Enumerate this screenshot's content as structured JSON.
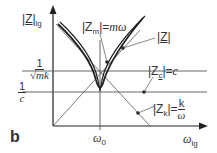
{
  "figure": {
    "panel_label": "b",
    "y_axis": {
      "label_main": "Z",
      "label_sub": "lg"
    },
    "x_axis": {
      "label_main": "ω",
      "label_sub": "lg"
    },
    "x_tick": {
      "label_main": "ω",
      "label_sub": "0"
    },
    "y_ticks": [
      {
        "num": "1",
        "den": "√mk"
      },
      {
        "num": "1",
        "den": "c"
      }
    ],
    "annotations": {
      "zm": {
        "lhs_main": "Z",
        "lhs_sub": "m",
        "rhs": "mω"
      },
      "z": {
        "main": "Z"
      },
      "zc": {
        "lhs_main": "Z",
        "lhs_sub": "c",
        "rhs": "c"
      },
      "zk": {
        "lhs_main": "Z",
        "lhs_sub": "k",
        "num": "k",
        "den": "ω"
      }
    },
    "colors": {
      "line": "#222222",
      "thin": "#555555",
      "axis": "#222222"
    }
  }
}
